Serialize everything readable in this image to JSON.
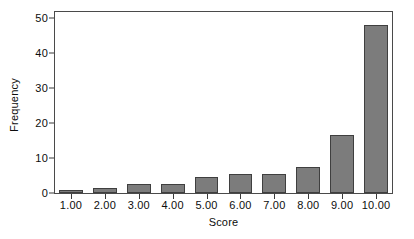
{
  "chart_data": {
    "type": "bar",
    "title": "",
    "subtitle": "",
    "xlabel": "Score",
    "ylabel": "Frequency",
    "categories": [
      "1.00",
      "2.00",
      "3.00",
      "4.00",
      "5.00",
      "6.00",
      "7.00",
      "8.00",
      "9.00",
      "10.00"
    ],
    "values": [
      1,
      1.5,
      2.5,
      2.5,
      4.5,
      5.5,
      5.5,
      7.5,
      16.5,
      48
    ],
    "series": [
      {
        "name": "Frequency",
        "values": [
          1,
          1.5,
          2.5,
          2.5,
          4.5,
          5.5,
          5.5,
          7.5,
          16.5,
          48
        ]
      }
    ],
    "ylim": [
      0,
      52
    ],
    "yticks": [
      0,
      10,
      20,
      30,
      40,
      50
    ],
    "ytick_labels": [
      "0",
      "10",
      "20",
      "30",
      "40",
      "50"
    ],
    "xtick_labels": [
      "1.00",
      "2.00",
      "3.00",
      "4.00",
      "5.00",
      "6.00",
      "7.00",
      "8.00",
      "9.00",
      "10.00"
    ],
    "grid": false,
    "legend": null,
    "legend_position": "none",
    "bar_color": "#7c7c7c",
    "bar_edge_color": "#3f3f3f",
    "axis_color": "#4a4a4a",
    "text_color": "#0d0d0d",
    "background": "#ffffff",
    "annotations": []
  }
}
